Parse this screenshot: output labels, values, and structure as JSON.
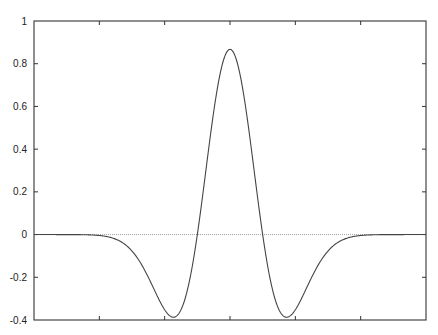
{
  "chart_data": {
    "type": "line",
    "title": "",
    "xlabel": "",
    "ylabel": "",
    "xlim": [
      -6,
      6
    ],
    "ylim": [
      -0.4,
      1
    ],
    "x_ticks": [
      -4,
      -2,
      0,
      2,
      4
    ],
    "x_tick_labels": [
      "",
      "",
      "",
      "",
      ""
    ],
    "y_ticks": [
      -0.4,
      -0.2,
      0,
      0.2,
      0.4,
      0.6,
      0.8,
      1
    ],
    "y_tick_labels": [
      "-0.4",
      "-0.2",
      "0",
      "0.2",
      "0.4",
      "0.6",
      "0.8",
      "1"
    ],
    "grid": false,
    "legend": "none",
    "reference_lines": [
      {
        "axis": "y",
        "value": 0,
        "style": "dotted"
      }
    ],
    "series": [
      {
        "name": "mexican-hat-wavelet",
        "function": "(2/(sqrt(3)*pi^0.25)) * (1 - x^2) * exp(-x^2/2)",
        "x": [
          -6,
          -5,
          -4,
          -3,
          -2.5,
          -2,
          -1.732,
          -1.5,
          -1,
          -0.5,
          0,
          0.5,
          1,
          1.5,
          1.732,
          2,
          2.5,
          3,
          4,
          5,
          6
        ],
        "values": [
          -0.0,
          -0.0008,
          -0.0044,
          -0.0771,
          -0.1928,
          -0.352,
          -0.387,
          -0.3526,
          0.0,
          0.5736,
          0.8673,
          0.5736,
          0.0,
          -0.3526,
          -0.387,
          -0.352,
          -0.1928,
          -0.0771,
          -0.0044,
          -0.0008,
          -0.0
        ],
        "peak": {
          "x": 0,
          "y": 0.867
        },
        "minima": [
          {
            "x": -1.732,
            "y": -0.387
          },
          {
            "x": 1.732,
            "y": -0.387
          }
        ],
        "zero_crossings": [
          -1,
          1
        ]
      }
    ]
  }
}
